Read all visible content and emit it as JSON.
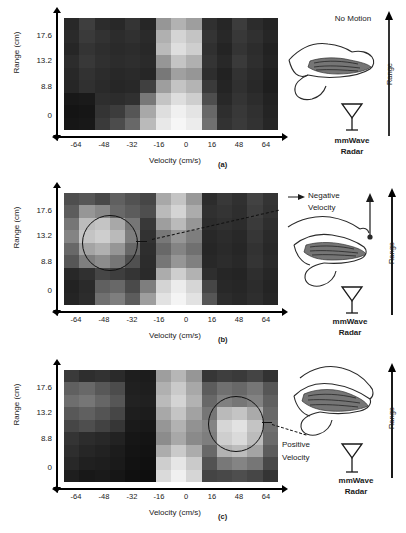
{
  "figure": {
    "panels": [
      {
        "tag": "(a)",
        "id": "panel-a",
        "axes": {
          "xlabel": "Velocity (cm/s)",
          "ylabel": "Range (cm)",
          "xticks": [
            "-64",
            "-48",
            "-32",
            "-16",
            "0",
            "16",
            "48",
            "64"
          ],
          "yticks": [
            "17.6",
            "13.2",
            "8.8",
            "0"
          ]
        },
        "illustration": {
          "caption": "No Motion",
          "range_label": "Range",
          "radar_label_line1": "mmWave",
          "radar_label_line2": "Radar",
          "hand_icon": "hand-side-view-icon",
          "radar_icon": "antenna-icon"
        },
        "annotation": null
      },
      {
        "tag": "(b)",
        "id": "panel-b",
        "axes": {
          "xlabel": "Velocity (cm/s)",
          "ylabel": "Range (cm)",
          "xticks": [
            "-64",
            "-48",
            "-32",
            "-16",
            "0",
            "16",
            "48",
            "64"
          ],
          "yticks": [
            "17.6",
            "13.2",
            "8.8",
            "0"
          ]
        },
        "illustration": {
          "caption": "",
          "range_label": "Range",
          "radar_label_line1": "mmWave",
          "radar_label_line2": "Radar",
          "hand_icon": "hand-finger-up-icon",
          "radar_icon": "antenna-icon"
        },
        "annotation": {
          "text_line1": "Negative",
          "text_line2": "Velocity",
          "marker": "circle",
          "connector": "dashed-line"
        }
      },
      {
        "tag": "(c)",
        "id": "panel-c",
        "axes": {
          "xlabel": "Velocity (cm/s)",
          "ylabel": "Range (cm)",
          "xticks": [
            "-64",
            "-48",
            "-32",
            "-16",
            "0",
            "16",
            "48",
            "64"
          ],
          "yticks": [
            "17.6",
            "13.2",
            "8.8",
            "0"
          ]
        },
        "illustration": {
          "caption": "",
          "range_label": "Range",
          "radar_label_line1": "mmWave",
          "radar_label_line2": "Radar",
          "hand_icon": "hand-finger-down-icon",
          "radar_icon": "antenna-icon"
        },
        "annotation": {
          "text_line1": "Positive",
          "text_line2": "Velocity",
          "marker": "circle",
          "connector": "dashed-line"
        }
      }
    ]
  },
  "chart_data": [
    {
      "type": "heatmap",
      "title": "(a) Range-Doppler map - No Motion",
      "xlabel": "Velocity (cm/s)",
      "ylabel": "Range (cm)",
      "xticks": [
        -64,
        -48,
        -32,
        -16,
        0,
        16,
        48,
        64
      ],
      "yticks": [
        17.6,
        13.2,
        8.8,
        0
      ],
      "xlim": [
        -72,
        72
      ],
      "ylim": [
        0,
        19.8
      ],
      "grid": false,
      "legend": "none",
      "colormap": "gray",
      "vmin": 0,
      "vmax": 255,
      "ncols": 14,
      "nrows": 9,
      "values": [
        [
          40,
          62,
          44,
          40,
          52,
          38,
          150,
          178,
          158,
          48,
          38,
          60,
          44,
          36
        ],
        [
          42,
          58,
          50,
          44,
          48,
          42,
          176,
          212,
          196,
          52,
          40,
          56,
          48,
          38
        ],
        [
          38,
          52,
          46,
          42,
          44,
          40,
          186,
          222,
          206,
          48,
          36,
          52,
          44,
          34
        ],
        [
          44,
          56,
          48,
          44,
          46,
          42,
          150,
          196,
          176,
          52,
          40,
          58,
          46,
          36
        ],
        [
          40,
          50,
          44,
          40,
          42,
          38,
          120,
          160,
          150,
          46,
          34,
          50,
          42,
          32
        ],
        [
          38,
          48,
          42,
          38,
          40,
          64,
          158,
          196,
          180,
          58,
          36,
          48,
          40,
          30
        ],
        [
          24,
          26,
          46,
          44,
          48,
          120,
          196,
          222,
          206,
          78,
          40,
          52,
          44,
          34
        ],
        [
          20,
          22,
          52,
          60,
          86,
          168,
          222,
          240,
          228,
          104,
          46,
          56,
          48,
          36
        ],
        [
          22,
          24,
          58,
          76,
          104,
          186,
          232,
          246,
          236,
          112,
          50,
          58,
          50,
          38
        ]
      ]
    },
    {
      "type": "heatmap",
      "title": "(b) Range-Doppler map - Negative Velocity",
      "xlabel": "Velocity (cm/s)",
      "ylabel": "Range (cm)",
      "xticks": [
        -64,
        -48,
        -32,
        -16,
        0,
        16,
        48,
        64
      ],
      "yticks": [
        17.6,
        13.2,
        8.8,
        0
      ],
      "xlim": [
        -72,
        72
      ],
      "ylim": [
        0,
        19.8
      ],
      "grid": false,
      "legend": "none",
      "colormap": "gray",
      "vmin": 0,
      "vmax": 255,
      "ncols": 14,
      "nrows": 9,
      "annotation": {
        "type": "circle",
        "center_x": -40,
        "center_y": 12.5,
        "radius_x": 26,
        "radius_y": 4.5,
        "label": "Negative Velocity"
      },
      "values": [
        [
          78,
          86,
          72,
          96,
          82,
          70,
          168,
          196,
          152,
          44,
          56,
          48,
          66,
          52
        ],
        [
          92,
          150,
          136,
          104,
          92,
          78,
          186,
          212,
          172,
          48,
          52,
          46,
          62,
          50
        ],
        [
          118,
          188,
          196,
          168,
          118,
          56,
          158,
          186,
          150,
          44,
          48,
          44,
          58,
          46
        ],
        [
          132,
          196,
          206,
          186,
          126,
          50,
          120,
          150,
          126,
          40,
          44,
          40,
          54,
          42
        ],
        [
          104,
          164,
          176,
          150,
          104,
          46,
          104,
          132,
          112,
          38,
          42,
          38,
          50,
          40
        ],
        [
          86,
          126,
          140,
          118,
          80,
          44,
          118,
          150,
          128,
          40,
          44,
          40,
          52,
          42
        ],
        [
          40,
          48,
          70,
          62,
          52,
          42,
          172,
          206,
          178,
          46,
          38,
          36,
          46,
          38
        ],
        [
          34,
          42,
          96,
          104,
          74,
          126,
          212,
          236,
          214,
          70,
          40,
          38,
          44,
          36
        ],
        [
          36,
          44,
          112,
          126,
          92,
          158,
          226,
          244,
          226,
          86,
          44,
          40,
          46,
          38
        ]
      ]
    },
    {
      "type": "heatmap",
      "title": "(c) Range-Doppler map - Positive Velocity",
      "xlabel": "Velocity (cm/s)",
      "ylabel": "Range (cm)",
      "xticks": [
        -64,
        -48,
        -32,
        -16,
        0,
        16,
        48,
        64
      ],
      "yticks": [
        17.6,
        13.2,
        8.8,
        0
      ],
      "xlim": [
        -72,
        72
      ],
      "ylim": [
        0,
        19.8
      ],
      "grid": false,
      "legend": "none",
      "colormap": "gray",
      "vmin": 0,
      "vmax": 255,
      "ncols": 14,
      "nrows": 9,
      "annotation": {
        "type": "circle",
        "center_x": 52,
        "center_y": 10.5,
        "radius_x": 26,
        "radius_y": 4.5,
        "label": "Positive Velocity"
      },
      "values": [
        [
          58,
          46,
          50,
          42,
          30,
          28,
          158,
          182,
          150,
          54,
          62,
          58,
          68,
          50
        ],
        [
          96,
          104,
          88,
          76,
          32,
          30,
          176,
          202,
          168,
          92,
          112,
          104,
          118,
          86
        ],
        [
          110,
          118,
          102,
          86,
          34,
          32,
          186,
          212,
          178,
          104,
          128,
          118,
          130,
          96
        ],
        [
          88,
          96,
          84,
          70,
          30,
          28,
          168,
          196,
          162,
          118,
          186,
          196,
          170,
          104
        ],
        [
          70,
          78,
          66,
          54,
          26,
          24,
          150,
          178,
          146,
          132,
          214,
          226,
          196,
          112
        ],
        [
          52,
          44,
          40,
          34,
          22,
          20,
          140,
          168,
          138,
          126,
          206,
          218,
          188,
          106
        ],
        [
          46,
          38,
          34,
          28,
          20,
          18,
          172,
          202,
          172,
          104,
          178,
          188,
          164,
          92
        ],
        [
          40,
          32,
          30,
          26,
          18,
          16,
          206,
          230,
          202,
          82,
          120,
          132,
          118,
          72
        ],
        [
          30,
          24,
          26,
          22,
          16,
          14,
          218,
          240,
          214,
          68,
          72,
          78,
          70,
          52
        ]
      ]
    }
  ]
}
